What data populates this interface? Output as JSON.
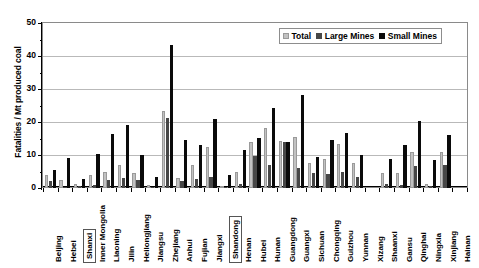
{
  "chart_data": {
    "type": "bar",
    "title": "",
    "xlabel": "",
    "ylabel": "Fatalities / Mt produced coal",
    "ylim": [
      0,
      50
    ],
    "yticks": [
      0,
      10,
      20,
      30,
      40,
      50
    ],
    "ytick_labels": [
      "0",
      "10",
      "20",
      "30",
      "40",
      "50"
    ],
    "grid": true,
    "legend_position": "top-right",
    "categories": [
      "Beijing",
      "Hebei",
      "Shanxi",
      "Inner Mongolia",
      "Liaoning",
      "Jilin",
      "Heilongjiang",
      "Jiangsu",
      "Zhejiang",
      "Anhui",
      "Fujian",
      "Jiangxi",
      "Shandong",
      "Henan",
      "Hubei",
      "Hunan",
      "Guangdong",
      "Guangxi",
      "Sichuan",
      "Chongqing",
      "Guizhou",
      "Yunnan",
      "Xizang",
      "Shaanxi",
      "Gansu",
      "Qinghai",
      "Ningxia",
      "Xinjiang",
      "Hainan"
    ],
    "highlighted_categories": [
      "Shanxi",
      "Shandong"
    ],
    "series": [
      {
        "name": "Total",
        "color": "#c2c2c2",
        "values": [
          3.9,
          2.5,
          1.3,
          4.0,
          5.0,
          7.1,
          4.4,
          0.9,
          23.3,
          3.1,
          7.1,
          12.5,
          0.7,
          4.8,
          13.9,
          18.1,
          14.3,
          15.6,
          7.5,
          8.8,
          13.2,
          7.7,
          0.0,
          4.6,
          4.6,
          11.0,
          1.2,
          11.0,
          0.0
        ]
      },
      {
        "name": "Large Mines",
        "color": "#474747",
        "values": [
          2.2,
          0.2,
          0.7,
          0.8,
          2.4,
          3.1,
          2.4,
          0.2,
          21.3,
          2.2,
          2.8,
          3.4,
          0.2,
          1.1,
          9.6,
          7.0,
          14.0,
          6.2,
          4.6,
          4.1,
          4.9,
          3.4,
          0.0,
          1.2,
          0.9,
          6.8,
          0.6,
          7.0,
          0.0
        ]
      },
      {
        "name": "Small Mines",
        "color": "#0a0a0a",
        "values": [
          5.4,
          9.0,
          2.8,
          10.3,
          16.3,
          19.0,
          10.0,
          3.4,
          43.2,
          14.6,
          13.0,
          21.0,
          3.9,
          11.4,
          15.3,
          24.2,
          13.8,
          28.1,
          9.4,
          14.4,
          16.6,
          9.9,
          0.0,
          8.8,
          13.1,
          20.3,
          8.4,
          16.2,
          0.0
        ]
      }
    ]
  },
  "legend": {
    "items": [
      {
        "label": "Total"
      },
      {
        "label": "Large Mines"
      },
      {
        "label": "Small Mines"
      }
    ]
  }
}
